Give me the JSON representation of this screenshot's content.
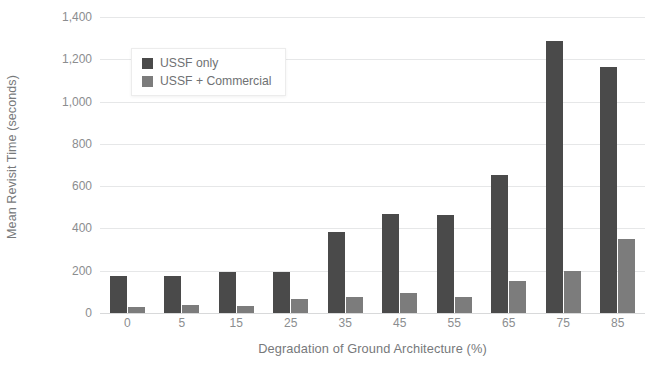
{
  "chart_data": {
    "type": "bar",
    "title": "",
    "xlabel": "Degradation of Ground Architecture (%)",
    "ylabel": "Mean Revisit Time (seconds)",
    "categories": [
      "0",
      "5",
      "15",
      "25",
      "35",
      "45",
      "55",
      "65",
      "75",
      "85"
    ],
    "ylim": [
      0,
      1400
    ],
    "yticks": [
      0,
      200,
      400,
      600,
      800,
      1000,
      1200,
      1400
    ],
    "ytick_labels": [
      "0",
      "200",
      "400",
      "600",
      "800",
      "1,000",
      "1,200",
      "1,400"
    ],
    "grid": true,
    "legend_position": "upper-left-inside",
    "series": [
      {
        "name": "USSF only",
        "color": "#4a4a4a",
        "values": [
          175,
          175,
          193,
          193,
          385,
          470,
          465,
          655,
          1285,
          1165
        ]
      },
      {
        "name": "USSF + Commercial",
        "color": "#7c7c7c",
        "values": [
          28,
          38,
          32,
          65,
          78,
          95,
          75,
          150,
          197,
          352
        ]
      }
    ]
  },
  "legend": {
    "items": [
      {
        "label": "USSF only",
        "color": "#4a4a4a",
        "swatch_name": "legend-swatch-ussf-only"
      },
      {
        "label": "USSF + Commercial",
        "color": "#7c7c7c",
        "swatch_name": "legend-swatch-ussf-commercial"
      }
    ]
  },
  "colors": {
    "primary_series": "#4a4a4a",
    "secondary_series": "#7c7c7c",
    "gridline": "#e6e7e8",
    "axis_text": "#8b8d8f",
    "title_text": "#77797b",
    "background": "#ffffff"
  }
}
